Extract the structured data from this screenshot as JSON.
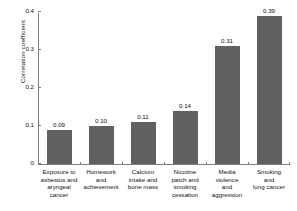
{
  "chart_data": {
    "type": "bar",
    "title": "",
    "subtitle": "",
    "xlabel": "",
    "ylabel": "Correlation coefficient",
    "ylim": [
      0,
      0.4
    ],
    "yticks": [
      "0",
      "0.1",
      "0.2",
      "0.3",
      "0.4"
    ],
    "ytick_values": [
      0,
      0.1,
      0.2,
      0.3,
      0.4
    ],
    "grid": false,
    "legend": null,
    "categories": [
      "Exposure to asbestos and aryngeal cancer",
      "Homework and achievement",
      "Calcium intake and bone mass",
      "Nicotine patch and smoking cessation",
      "Media violence and aggression",
      "Smoking and lung cancer"
    ],
    "category_lines": [
      [
        "Exposure to",
        "asbestos and",
        "aryngeal cancer"
      ],
      [
        "Homework",
        "and",
        "achievement"
      ],
      [
        "Calcium",
        "intake and",
        "bone mass"
      ],
      [
        "Nicotine",
        "patch and",
        "smoking",
        "cessation"
      ],
      [
        "Media",
        "violence",
        "and",
        "aggression"
      ],
      [
        "Smoking",
        "and",
        "lung cancer"
      ]
    ],
    "values": [
      0.09,
      0.1,
      0.11,
      0.14,
      0.31,
      0.39
    ],
    "value_labels": [
      "0.09",
      "0.10",
      "0.11",
      "0.14",
      "0.31",
      "0.39"
    ],
    "bar_color": "#606060",
    "axis_color": "#7d7d7d",
    "text_color": "#111111",
    "background": "#ffffff"
  }
}
